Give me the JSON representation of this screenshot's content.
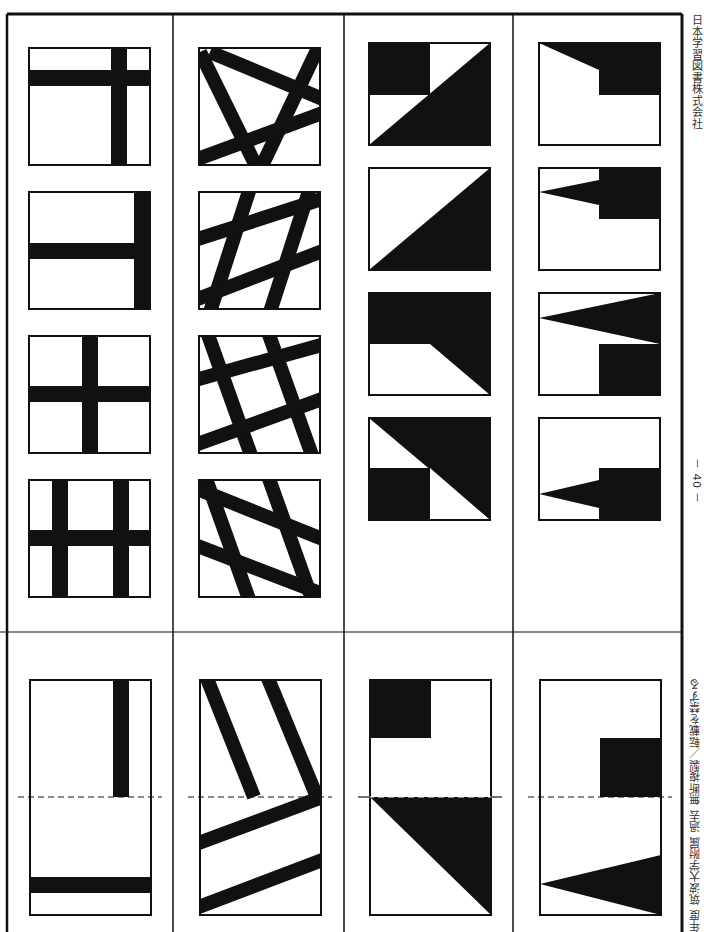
{
  "page": {
    "orientation": "rotated-90",
    "publisher": "日本学習図書株式会社",
    "page_number": "－ 40 －",
    "footer_note": "年度 筑波大学附属 過去 無断複製／転載を禁ずる"
  },
  "colors": {
    "ink": "#111111",
    "paper": "#ffffff"
  },
  "layout": {
    "columns_x": [
      7,
      173,
      344,
      513,
      682
    ],
    "top_y": 14,
    "divider_y": 632,
    "bottom_y": 932,
    "option_rows_y": [
      48,
      191,
      335,
      480
    ],
    "option_size": 120,
    "question_box": {
      "y": 680,
      "h": 236,
      "fold_y": 797
    }
  },
  "problems": [
    {
      "id": "problem-1",
      "type": "bars",
      "question": "left vertical bar top-right, horizontal bar near bottom; folded along dashed line",
      "options": [
        "grid-top-right-cross",
        "right-edge-T",
        "center-cross",
        "double-vertical-cross"
      ]
    },
    {
      "id": "problem-2",
      "type": "diagonal-stripes",
      "question": "two slanted bars above fold, two slanted bars below fold",
      "options": [
        "star-stripes",
        "lattice-a",
        "lattice-b",
        "lattice-c"
      ]
    },
    {
      "id": "problem-3",
      "type": "triangles",
      "question": "black square top-left, diagonal black triangle below fold",
      "options": [
        "square-plus-diagonal",
        "diagonal-half",
        "trapezoid-top",
        "triangle-with-square"
      ]
    },
    {
      "id": "problem-4",
      "type": "wedges",
      "question": "black square right above fold, wedge triangle below fold",
      "options": [
        "slope-step",
        "wedge-step-top",
        "large-wedge-step",
        "wedge-step-bottom"
      ]
    }
  ]
}
